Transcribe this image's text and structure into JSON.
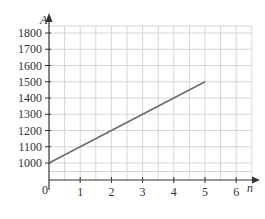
{
  "chart_data": {
    "type": "line",
    "title": "",
    "xlabel": "n",
    "ylabel": "A",
    "origin_label": "0",
    "xlim": [
      0,
      6.5
    ],
    "ylim": [
      900,
      1850
    ],
    "x_ticks": [
      1,
      2,
      3,
      4,
      5,
      6
    ],
    "y_ticks": [
      1000,
      1100,
      1200,
      1300,
      1400,
      1500,
      1600,
      1700,
      1800
    ],
    "grid": true,
    "grid_minor_x_step": 0.5,
    "grid_y_step": 100,
    "legend": null,
    "series": [
      {
        "name": "A",
        "x": [
          0,
          5
        ],
        "values": [
          1000,
          1500
        ],
        "color": "#666666"
      }
    ]
  },
  "colors": {
    "grid": "#d6d6d6",
    "axis": "#333333",
    "line": "#6b6b6b"
  }
}
